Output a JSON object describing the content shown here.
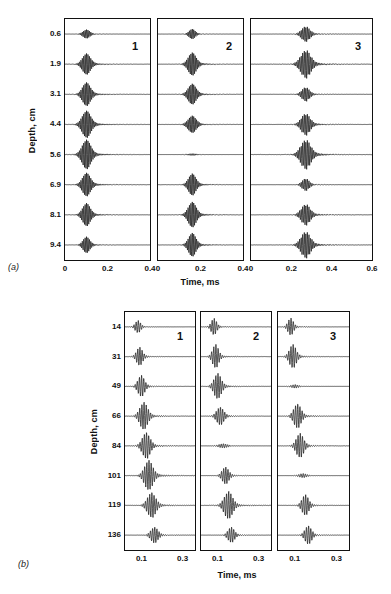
{
  "figure": {
    "panels": [
      {
        "tag": "(a)",
        "ylabel": "Depth, cm",
        "xlabel": "Time, ms",
        "depths": [
          "0.6",
          "1.9",
          "3.1",
          "4.4",
          "5.6",
          "6.9",
          "8.1",
          "9.4"
        ],
        "columns": [
          {
            "number": "1",
            "xticks": [
              "0",
              "0.2",
              "0.4"
            ],
            "xlim": [
              0,
              0.4
            ]
          },
          {
            "number": "2",
            "xticks": [
              "0",
              "0.2",
              "0.4"
            ],
            "xlim": [
              0,
              0.4
            ]
          },
          {
            "number": "3",
            "xticks": [
              "0",
              "0.2",
              "0.4",
              "0.6"
            ],
            "xlim": [
              0,
              0.6
            ]
          }
        ]
      },
      {
        "tag": "(b)",
        "ylabel": "Depth, cm",
        "xlabel": "Time, ms",
        "depths": [
          "14",
          "31",
          "49",
          "66",
          "84",
          "101",
          "119",
          "136"
        ],
        "columns": [
          {
            "number": "1",
            "xticks": [
              "0.1",
              "0.3"
            ],
            "xlim": [
              0.02,
              0.36
            ]
          },
          {
            "number": "2",
            "xticks": [
              "0.1",
              "0.3"
            ],
            "xlim": [
              0.02,
              0.36
            ]
          },
          {
            "number": "3",
            "xticks": [
              "0.1",
              "0.3"
            ],
            "xlim": [
              0.02,
              0.36
            ]
          }
        ]
      }
    ]
  },
  "chart_data": [
    {
      "type": "line",
      "title": "(a)",
      "xlabel": "Time, ms",
      "ylabel": "Depth, cm",
      "description": "Eight stacked acoustic wave-packet traces versus time, one per depth, repeated for receivers 1, 2 and 3.",
      "categories": [
        "0.6",
        "1.9",
        "3.1",
        "4.4",
        "5.6",
        "6.9",
        "8.1",
        "9.4"
      ],
      "grid": false,
      "legend": "none",
      "panels": [
        {
          "name": "1",
          "xlim": [
            0,
            0.4
          ],
          "xticks": [
            0,
            0.2,
            0.4
          ],
          "traces": [
            {
              "depth": 0.6,
              "center_ms": 0.1,
              "amplitude": 0.3,
              "width_ms": 0.022,
              "freq_khz": 150
            },
            {
              "depth": 1.9,
              "center_ms": 0.1,
              "amplitude": 0.72,
              "width_ms": 0.026,
              "freq_khz": 150
            },
            {
              "depth": 3.1,
              "center_ms": 0.1,
              "amplitude": 0.8,
              "width_ms": 0.026,
              "freq_khz": 150
            },
            {
              "depth": 4.4,
              "center_ms": 0.1,
              "amplitude": 0.92,
              "width_ms": 0.028,
              "freq_khz": 150
            },
            {
              "depth": 5.6,
              "center_ms": 0.1,
              "amplitude": 1.0,
              "width_ms": 0.028,
              "freq_khz": 150
            },
            {
              "depth": 6.9,
              "center_ms": 0.1,
              "amplitude": 0.8,
              "width_ms": 0.026,
              "freq_khz": 150
            },
            {
              "depth": 8.1,
              "center_ms": 0.1,
              "amplitude": 0.78,
              "width_ms": 0.025,
              "freq_khz": 150
            },
            {
              "depth": 9.4,
              "center_ms": 0.1,
              "amplitude": 0.55,
              "width_ms": 0.022,
              "freq_khz": 150
            }
          ]
        },
        {
          "name": "2",
          "xlim": [
            0,
            0.4
          ],
          "xticks": [
            0,
            0.2,
            0.4
          ],
          "traces": [
            {
              "depth": 0.6,
              "center_ms": 0.16,
              "amplitude": 0.34,
              "width_ms": 0.02,
              "freq_khz": 150
            },
            {
              "depth": 1.9,
              "center_ms": 0.16,
              "amplitude": 0.78,
              "width_ms": 0.026,
              "freq_khz": 150
            },
            {
              "depth": 3.1,
              "center_ms": 0.16,
              "amplitude": 0.7,
              "width_ms": 0.026,
              "freq_khz": 150
            },
            {
              "depth": 4.4,
              "center_ms": 0.16,
              "amplitude": 0.58,
              "width_ms": 0.026,
              "freq_khz": 150
            },
            {
              "depth": 5.6,
              "center_ms": 0.16,
              "amplitude": 0.06,
              "width_ms": 0.03,
              "freq_khz": 150
            },
            {
              "depth": 6.9,
              "center_ms": 0.16,
              "amplitude": 0.74,
              "width_ms": 0.024,
              "freq_khz": 150
            },
            {
              "depth": 8.1,
              "center_ms": 0.16,
              "amplitude": 0.86,
              "width_ms": 0.026,
              "freq_khz": 150
            },
            {
              "depth": 9.4,
              "center_ms": 0.16,
              "amplitude": 0.8,
              "width_ms": 0.024,
              "freq_khz": 150
            }
          ]
        },
        {
          "name": "3",
          "xlim": [
            0,
            0.6
          ],
          "xticks": [
            0,
            0.2,
            0.4,
            0.6
          ],
          "traces": [
            {
              "depth": 0.6,
              "center_ms": 0.27,
              "amplitude": 0.52,
              "width_ms": 0.028,
              "freq_khz": 130
            },
            {
              "depth": 1.9,
              "center_ms": 0.27,
              "amplitude": 0.95,
              "width_ms": 0.034,
              "freq_khz": 130
            },
            {
              "depth": 3.1,
              "center_ms": 0.27,
              "amplitude": 0.48,
              "width_ms": 0.026,
              "freq_khz": 130
            },
            {
              "depth": 4.4,
              "center_ms": 0.27,
              "amplitude": 0.74,
              "width_ms": 0.03,
              "freq_khz": 130
            },
            {
              "depth": 5.6,
              "center_ms": 0.27,
              "amplitude": 1.0,
              "width_ms": 0.034,
              "freq_khz": 130
            },
            {
              "depth": 6.9,
              "center_ms": 0.27,
              "amplitude": 0.42,
              "width_ms": 0.024,
              "freq_khz": 130
            },
            {
              "depth": 8.1,
              "center_ms": 0.27,
              "amplitude": 0.72,
              "width_ms": 0.03,
              "freq_khz": 130
            },
            {
              "depth": 9.4,
              "center_ms": 0.27,
              "amplitude": 0.9,
              "width_ms": 0.032,
              "freq_khz": 130
            }
          ]
        }
      ]
    },
    {
      "type": "line",
      "title": "(b)",
      "xlabel": "Time, ms",
      "ylabel": "Depth, cm",
      "description": "Eight stacked acoustic wave-packet traces versus time, one per depth, repeated for receivers 1, 2 and 3; arrival time increases with depth.",
      "categories": [
        "14",
        "31",
        "49",
        "66",
        "84",
        "101",
        "119",
        "136"
      ],
      "grid": false,
      "legend": "none",
      "panels": [
        {
          "name": "1",
          "xlim": [
            0.02,
            0.36
          ],
          "xticks": [
            0.1,
            0.3
          ],
          "traces": [
            {
              "depth": 14,
              "center_ms": 0.082,
              "amplitude": 0.42,
              "width_ms": 0.018,
              "freq_khz": 95
            },
            {
              "depth": 31,
              "center_ms": 0.09,
              "amplitude": 0.62,
              "width_ms": 0.02,
              "freq_khz": 95
            },
            {
              "depth": 49,
              "center_ms": 0.098,
              "amplitude": 0.72,
              "width_ms": 0.022,
              "freq_khz": 95
            },
            {
              "depth": 66,
              "center_ms": 0.11,
              "amplitude": 0.92,
              "width_ms": 0.026,
              "freq_khz": 95
            },
            {
              "depth": 84,
              "center_ms": 0.122,
              "amplitude": 0.88,
              "width_ms": 0.026,
              "freq_khz": 95
            },
            {
              "depth": 101,
              "center_ms": 0.134,
              "amplitude": 1.0,
              "width_ms": 0.028,
              "freq_khz": 95
            },
            {
              "depth": 119,
              "center_ms": 0.148,
              "amplitude": 0.84,
              "width_ms": 0.028,
              "freq_khz": 95
            },
            {
              "depth": 136,
              "center_ms": 0.162,
              "amplitude": 0.54,
              "width_ms": 0.024,
              "freq_khz": 95
            }
          ]
        },
        {
          "name": "2",
          "xlim": [
            0.02,
            0.36
          ],
          "xticks": [
            0.1,
            0.3
          ],
          "traces": [
            {
              "depth": 14,
              "center_ms": 0.082,
              "amplitude": 0.56,
              "width_ms": 0.018,
              "freq_khz": 95
            },
            {
              "depth": 31,
              "center_ms": 0.09,
              "amplitude": 0.8,
              "width_ms": 0.02,
              "freq_khz": 95
            },
            {
              "depth": 49,
              "center_ms": 0.1,
              "amplitude": 0.86,
              "width_ms": 0.024,
              "freq_khz": 95
            },
            {
              "depth": 66,
              "center_ms": 0.112,
              "amplitude": 0.6,
              "width_ms": 0.024,
              "freq_khz": 95
            },
            {
              "depth": 84,
              "center_ms": 0.126,
              "amplitude": 0.14,
              "width_ms": 0.03,
              "freq_khz": 95
            },
            {
              "depth": 101,
              "center_ms": 0.138,
              "amplitude": 0.58,
              "width_ms": 0.022,
              "freq_khz": 95
            },
            {
              "depth": 119,
              "center_ms": 0.152,
              "amplitude": 0.92,
              "width_ms": 0.028,
              "freq_khz": 95
            },
            {
              "depth": 136,
              "center_ms": 0.166,
              "amplitude": 0.52,
              "width_ms": 0.022,
              "freq_khz": 95
            }
          ]
        },
        {
          "name": "3",
          "xlim": [
            0.02,
            0.36
          ],
          "xticks": [
            0.1,
            0.3
          ],
          "traces": [
            {
              "depth": 14,
              "center_ms": 0.08,
              "amplitude": 0.58,
              "width_ms": 0.018,
              "freq_khz": 95
            },
            {
              "depth": 31,
              "center_ms": 0.09,
              "amplitude": 0.8,
              "width_ms": 0.022,
              "freq_khz": 95
            },
            {
              "depth": 49,
              "center_ms": 0.1,
              "amplitude": 0.12,
              "width_ms": 0.024,
              "freq_khz": 95
            },
            {
              "depth": 66,
              "center_ms": 0.112,
              "amplitude": 0.82,
              "width_ms": 0.024,
              "freq_khz": 95
            },
            {
              "depth": 84,
              "center_ms": 0.124,
              "amplitude": 0.82,
              "width_ms": 0.024,
              "freq_khz": 95
            },
            {
              "depth": 101,
              "center_ms": 0.138,
              "amplitude": 0.14,
              "width_ms": 0.026,
              "freq_khz": 95
            },
            {
              "depth": 119,
              "center_ms": 0.15,
              "amplitude": 0.7,
              "width_ms": 0.022,
              "freq_khz": 95
            },
            {
              "depth": 136,
              "center_ms": 0.164,
              "amplitude": 0.62,
              "width_ms": 0.022,
              "freq_khz": 95
            }
          ]
        }
      ]
    }
  ]
}
